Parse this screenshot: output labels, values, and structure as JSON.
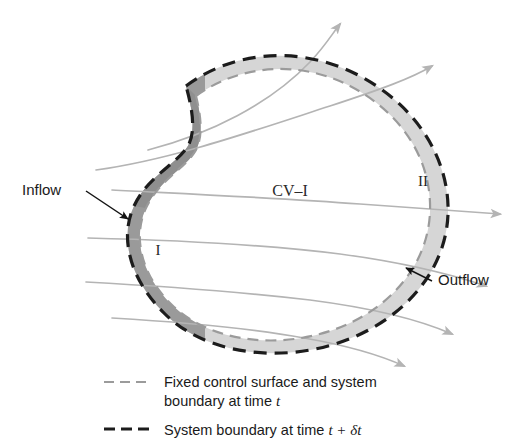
{
  "figure": {
    "type": "diagram",
    "labels": {
      "inflow": "Inflow",
      "outflow": "Outflow",
      "control_volume": "CV–I",
      "region_one": "I",
      "region_two": "II"
    },
    "legend": [
      {
        "id": "fixed-control-surface",
        "style": "dashed-light",
        "color": "#9b9b9b",
        "line1": "Fixed control surface and system",
        "line2_prefix": "boundary at time ",
        "line2_symbol": "t"
      },
      {
        "id": "system-boundary-later",
        "style": "dashed-dark-bold",
        "color": "#1c1c1c",
        "line1_prefix": "System boundary at time ",
        "line1_symbol": "t + δt"
      }
    ],
    "colors": {
      "region_one_fill": "#9a9a9a",
      "region_two_fill": "#d6d6d6",
      "control_surface_stroke": "#9b9b9b",
      "system_boundary_stroke": "#1c1c1c",
      "streamline_stroke": "#b4b4b4",
      "label_text": "#1a1a1a"
    },
    "streamlines": {
      "count": 6,
      "direction": "left-to-right",
      "arrowheads": true
    }
  }
}
